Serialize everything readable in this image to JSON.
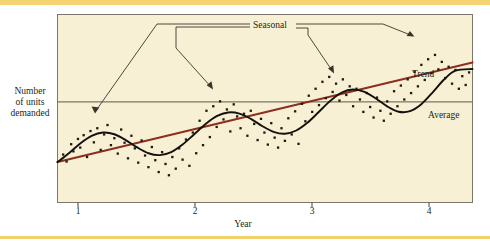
{
  "figure": {
    "background_color": "#ffffff",
    "plot_background_color": "#f7f0d5",
    "rule_color": "#f5d272",
    "frame_color": "#7c7668"
  },
  "axes": {
    "y_title": "Number of units demanded",
    "y_title_lines": [
      "Number",
      "of units",
      "demanded"
    ],
    "x_title": "Year",
    "x_ticks": [
      "1",
      "2",
      "3",
      "4"
    ]
  },
  "annotations": {
    "seasonal": "Seasonal",
    "trend": "Trend",
    "average": "Average"
  },
  "colors": {
    "trend_line": "#8c2f1c",
    "seasonal_curve": "#14110c",
    "average_line": "#7c7668",
    "scatter_point": "#20190f",
    "leader_line": "#3a342a"
  },
  "chart_data": {
    "type": "scatter",
    "title": "",
    "xlabel": "Year",
    "ylabel": "Number of units demanded",
    "xlim": [
      0.7,
      4.35
    ],
    "ylim": [
      0,
      10
    ],
    "grid": false,
    "legend_position": "inline-annotations",
    "x_tick_values": [
      1,
      2,
      3,
      4
    ],
    "y_tick_values": [],
    "series": [
      {
        "name": "Trend",
        "type": "line",
        "color": "#8c2f1c",
        "x": [
          0.7,
          4.35
        ],
        "values": [
          2.15,
          7.45
        ],
        "description": "Straight rising linear trend line"
      },
      {
        "name": "Average",
        "type": "line",
        "color": "#7c7668",
        "x": [
          0.7,
          4.35
        ],
        "values": [
          5.35,
          5.35
        ],
        "description": "Horizontal average line across full plot width"
      },
      {
        "name": "Seasonal",
        "type": "line",
        "color": "#14110c",
        "description": "Sinusoidal seasonal cycle superimposed on the rising trend; one full cycle per year",
        "period_years": 1.0,
        "amplitude": 1.35,
        "x": [
          0.7,
          0.8,
          0.9,
          1.0,
          1.1,
          1.2,
          1.3,
          1.4,
          1.5,
          1.6,
          1.7,
          1.8,
          1.9,
          2.0,
          2.1,
          2.2,
          2.3,
          2.4,
          2.5,
          2.6,
          2.7,
          2.8,
          2.9,
          3.0,
          3.1,
          3.2,
          3.3,
          3.4,
          3.5,
          3.6,
          3.7,
          3.8,
          3.9,
          4.0,
          4.1,
          4.2,
          4.35
        ],
        "values": [
          2.15,
          2.62,
          3.14,
          3.54,
          3.72,
          3.63,
          3.32,
          2.93,
          2.62,
          2.52,
          2.68,
          3.08,
          3.62,
          4.16,
          4.59,
          4.79,
          4.73,
          4.45,
          4.07,
          3.76,
          3.66,
          3.83,
          4.25,
          4.83,
          5.41,
          5.85,
          6.01,
          5.88,
          5.53,
          5.11,
          4.83,
          4.86,
          5.23,
          5.86,
          6.54,
          7.01,
          7.1
        ]
      },
      {
        "name": "Demand observations",
        "type": "scatter",
        "color": "#20190f",
        "marker": "square",
        "points": [
          [
            0.75,
            2.55
          ],
          [
            0.78,
            2.18
          ],
          [
            0.82,
            3.1
          ],
          [
            0.84,
            2.72
          ],
          [
            0.88,
            3.38
          ],
          [
            0.9,
            2.92
          ],
          [
            0.93,
            3.58
          ],
          [
            0.96,
            2.42
          ],
          [
            0.99,
            3.8
          ],
          [
            1.02,
            3.2
          ],
          [
            1.05,
            3.95
          ],
          [
            1.08,
            2.8
          ],
          [
            1.11,
            3.62
          ],
          [
            1.14,
            4.12
          ],
          [
            1.17,
            3.05
          ],
          [
            1.2,
            3.42
          ],
          [
            1.23,
            2.6
          ],
          [
            1.26,
            3.88
          ],
          [
            1.29,
            3.18
          ],
          [
            1.32,
            2.35
          ],
          [
            1.35,
            3.55
          ],
          [
            1.38,
            2.88
          ],
          [
            1.41,
            2.12
          ],
          [
            1.44,
            3.3
          ],
          [
            1.47,
            2.5
          ],
          [
            1.5,
            1.88
          ],
          [
            1.53,
            2.95
          ],
          [
            1.56,
            2.25
          ],
          [
            1.59,
            1.62
          ],
          [
            1.62,
            2.68
          ],
          [
            1.65,
            2.05
          ],
          [
            1.68,
            1.45
          ],
          [
            1.71,
            2.42
          ],
          [
            1.74,
            1.8
          ],
          [
            1.77,
            2.88
          ],
          [
            1.8,
            2.28
          ],
          [
            1.83,
            3.35
          ],
          [
            1.86,
            1.95
          ],
          [
            1.89,
            3.72
          ],
          [
            1.92,
            2.62
          ],
          [
            1.95,
            4.35
          ],
          [
            1.98,
            3.05
          ],
          [
            2.01,
            4.88
          ],
          [
            2.04,
            3.48
          ],
          [
            2.07,
            5.12
          ],
          [
            2.1,
            4.02
          ],
          [
            2.13,
            5.38
          ],
          [
            2.16,
            4.42
          ],
          [
            2.19,
            4.95
          ],
          [
            2.22,
            3.78
          ],
          [
            2.25,
            5.22
          ],
          [
            2.28,
            4.58
          ],
          [
            2.31,
            3.95
          ],
          [
            2.34,
            4.72
          ],
          [
            2.37,
            3.55
          ],
          [
            2.4,
            4.88
          ],
          [
            2.43,
            4.18
          ],
          [
            2.46,
            3.32
          ],
          [
            2.49,
            4.45
          ],
          [
            2.52,
            3.72
          ],
          [
            2.55,
            3.08
          ],
          [
            2.58,
            4.22
          ],
          [
            2.61,
            3.45
          ],
          [
            2.64,
            2.92
          ],
          [
            2.67,
            3.95
          ],
          [
            2.7,
            3.28
          ],
          [
            2.73,
            4.48
          ],
          [
            2.76,
            3.62
          ],
          [
            2.79,
            4.85
          ],
          [
            2.82,
            3.12
          ],
          [
            2.85,
            5.25
          ],
          [
            2.88,
            4.32
          ],
          [
            2.91,
            5.68
          ],
          [
            2.94,
            4.82
          ],
          [
            2.97,
            6.05
          ],
          [
            3.0,
            5.18
          ],
          [
            3.03,
            6.42
          ],
          [
            3.06,
            5.55
          ],
          [
            3.09,
            6.68
          ],
          [
            3.12,
            5.88
          ],
          [
            3.15,
            6.32
          ],
          [
            3.18,
            5.42
          ],
          [
            3.21,
            6.55
          ],
          [
            3.24,
            5.72
          ],
          [
            3.27,
            6.18
          ],
          [
            3.3,
            5.12
          ],
          [
            3.33,
            6.05
          ],
          [
            3.36,
            5.48
          ],
          [
            3.39,
            4.82
          ],
          [
            3.42,
            5.82
          ],
          [
            3.45,
            5.08
          ],
          [
            3.48,
            4.52
          ],
          [
            3.51,
            5.58
          ],
          [
            3.54,
            4.88
          ],
          [
            3.57,
            4.35
          ],
          [
            3.6,
            5.38
          ],
          [
            3.63,
            4.72
          ],
          [
            3.66,
            5.92
          ],
          [
            3.69,
            5.12
          ],
          [
            3.72,
            6.22
          ],
          [
            3.75,
            5.48
          ],
          [
            3.78,
            6.55
          ],
          [
            3.81,
            5.82
          ],
          [
            3.84,
            6.95
          ],
          [
            3.87,
            6.18
          ],
          [
            3.9,
            7.32
          ],
          [
            3.93,
            6.52
          ],
          [
            3.96,
            7.62
          ],
          [
            3.99,
            6.88
          ],
          [
            4.02,
            7.85
          ],
          [
            4.05,
            7.08
          ],
          [
            4.08,
            7.48
          ],
          [
            4.11,
            6.62
          ],
          [
            4.14,
            7.22
          ],
          [
            4.17,
            6.32
          ],
          [
            4.2,
            7.05
          ],
          [
            4.23,
            6.05
          ],
          [
            4.26,
            6.72
          ],
          [
            4.29,
            6.25
          ],
          [
            4.32,
            6.92
          ]
        ]
      }
    ],
    "leader_lines": [
      {
        "label": "Seasonal",
        "from": "label-left",
        "to_point": [
          1.07,
          3.55
        ]
      },
      {
        "label": "Seasonal",
        "from": "label-left",
        "to_point": [
          2.15,
          4.8
        ]
      },
      {
        "label": "Seasonal",
        "from": "label-right",
        "to_point": [
          3.08,
          5.35
        ]
      },
      {
        "label": "Seasonal",
        "from": "label-right",
        "to_point": [
          3.92,
          6.7
        ]
      }
    ]
  }
}
